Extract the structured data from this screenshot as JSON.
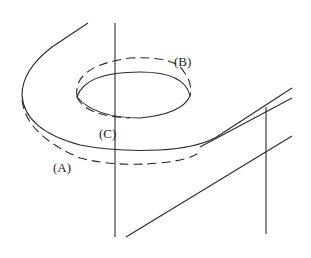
{
  "diagram": {
    "labels": {
      "a": "(A)",
      "b": "(B)",
      "c": "(C)"
    },
    "colors": {
      "line": "#2a2a2a",
      "background": "#ffffff"
    }
  }
}
